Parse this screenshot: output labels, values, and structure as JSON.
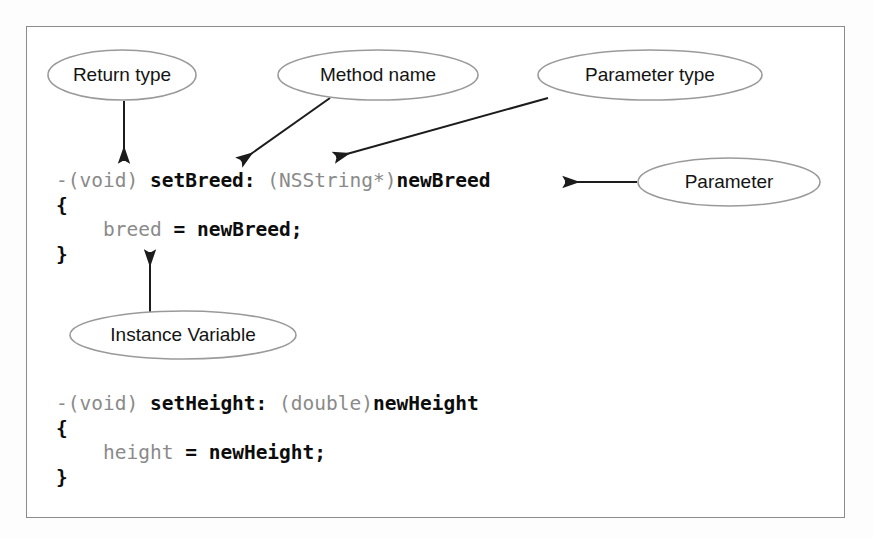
{
  "page": {
    "background_color": "#fdfdfd",
    "frame_border_color": "#8c8c8c"
  },
  "callouts": [
    {
      "id": "return-type",
      "label": "Return type",
      "cx": 122,
      "cy": 75,
      "rx": 74,
      "ry": 25,
      "points_to": "-(void)"
    },
    {
      "id": "method-name",
      "label": "Method name",
      "cx": 378,
      "cy": 75,
      "rx": 100,
      "ry": 25,
      "points_to": "setBreed:"
    },
    {
      "id": "parameter-type",
      "label": "Parameter type",
      "cx": 650,
      "cy": 75,
      "rx": 112,
      "ry": 25,
      "points_to": "(NSString*)"
    },
    {
      "id": "parameter",
      "label": "Parameter",
      "cx": 729,
      "cy": 182,
      "rx": 91,
      "ry": 24,
      "points_to": "newBreed"
    },
    {
      "id": "instance-variable",
      "label": "Instance Variable",
      "cx": 183,
      "cy": 335,
      "rx": 113,
      "ry": 24,
      "points_to": "breed"
    }
  ],
  "code": {
    "setbreed": {
      "lines": [
        [
          {
            "text": "-(void)",
            "style": "dim"
          },
          {
            "text": " ",
            "style": "dim"
          },
          {
            "text": "setBreed:",
            "style": "strong"
          },
          {
            "text": " ",
            "style": "dim"
          },
          {
            "text": "(NSString*)",
            "style": "dim"
          },
          {
            "text": "newBreed",
            "style": "strong"
          }
        ],
        [
          {
            "text": "{",
            "style": "strong"
          }
        ],
        [
          {
            "text": "    ",
            "style": "dim"
          },
          {
            "text": "breed",
            "style": "dim"
          },
          {
            "text": " ",
            "style": "dim"
          },
          {
            "text": "=",
            "style": "strong"
          },
          {
            "text": " ",
            "style": "dim"
          },
          {
            "text": "newBreed;",
            "style": "strong"
          }
        ],
        [
          {
            "text": "}",
            "style": "strong"
          }
        ]
      ]
    },
    "setheight": {
      "lines": [
        [
          {
            "text": "-(void)",
            "style": "dim"
          },
          {
            "text": " ",
            "style": "dim"
          },
          {
            "text": "setHeight:",
            "style": "strong"
          },
          {
            "text": " ",
            "style": "dim"
          },
          {
            "text": "(double)",
            "style": "dim"
          },
          {
            "text": "newHeight",
            "style": "strong"
          }
        ],
        [
          {
            "text": "{",
            "style": "strong"
          }
        ],
        [
          {
            "text": "    ",
            "style": "dim"
          },
          {
            "text": "height",
            "style": "dim"
          },
          {
            "text": " ",
            "style": "dim"
          },
          {
            "text": "=",
            "style": "strong"
          },
          {
            "text": " ",
            "style": "dim"
          },
          {
            "text": "newHeight;",
            "style": "strong"
          }
        ],
        [
          {
            "text": "}",
            "style": "strong"
          }
        ]
      ]
    }
  },
  "colors": {
    "code_strong": "#0d0d0d",
    "code_dim": "#8a8a8a",
    "callout_stroke": "#9a9a9a",
    "leader_line": "#1c1c1c"
  }
}
